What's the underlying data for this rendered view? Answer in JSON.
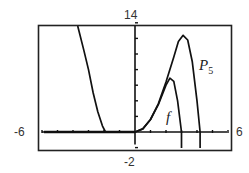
{
  "chart_data": {
    "type": "line",
    "title": "",
    "xlabel": "",
    "ylabel": "",
    "xlim": [
      -6,
      6
    ],
    "ylim": [
      -2,
      14
    ],
    "grid": false,
    "x_tick_step": 1,
    "y_tick_step": 2,
    "window_labels": {
      "xmin": "-6",
      "xmax": "6",
      "ymin": "-2",
      "ymax": "14"
    },
    "series": [
      {
        "name": "f",
        "points": [
          [
            -6,
            0
          ],
          [
            0,
            0
          ],
          [
            0.5,
            0.4
          ],
          [
            1,
            1.6
          ],
          [
            1.5,
            3.5
          ],
          [
            2,
            6.0
          ],
          [
            2.25,
            6.9
          ],
          [
            2.5,
            6.5
          ],
          [
            2.75,
            4.0
          ],
          [
            3,
            0
          ]
        ]
      },
      {
        "name": "P5",
        "points": [
          [
            -3.7,
            14
          ],
          [
            -3.3,
            10.5
          ],
          [
            -3,
            8
          ],
          [
            -2.7,
            5
          ],
          [
            -2.4,
            2.6
          ],
          [
            -2.1,
            0.8
          ],
          [
            -1.9,
            0
          ],
          [
            0,
            0
          ],
          [
            0.5,
            0.4
          ],
          [
            1,
            1.6
          ],
          [
            1.5,
            3.6
          ],
          [
            2,
            6.4
          ],
          [
            2.5,
            9.6
          ],
          [
            2.8,
            11.6
          ],
          [
            3.1,
            12.4
          ],
          [
            3.4,
            11.8
          ],
          [
            3.7,
            9.0
          ],
          [
            4.0,
            4.0
          ],
          [
            4.2,
            0
          ]
        ]
      }
    ],
    "annotations": [
      {
        "text": "f",
        "x": 2.0,
        "y": 1.5
      },
      {
        "text": "P5",
        "x": 4.5,
        "y": 8.5
      }
    ]
  },
  "labels": {
    "ymax": "14",
    "ymin": "-2",
    "xmin": "-6",
    "xmax": "6",
    "f": "f",
    "p": "P",
    "p_sub": "5"
  },
  "colors": {
    "curve": "#111111",
    "frame": "#222222",
    "axis": "#111111"
  }
}
